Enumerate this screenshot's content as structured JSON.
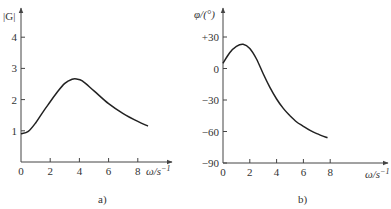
{
  "chart_data": [
    {
      "type": "line",
      "panel": "a)",
      "title": "",
      "ylabel": "|G|",
      "xlabel": "ω/s⁻¹",
      "xlim": [
        0,
        9
      ],
      "ylim": [
        0,
        4.5
      ],
      "xticks": [
        0,
        2,
        4,
        6,
        8
      ],
      "yticks": [
        1,
        2,
        3,
        4
      ],
      "grid": false,
      "series": [
        {
          "name": "|G|",
          "x": [
            0,
            0.5,
            1,
            1.5,
            2,
            2.5,
            3,
            3.5,
            3.8,
            4.2,
            5,
            6,
            7,
            8,
            8.7
          ],
          "y": [
            0.9,
            0.98,
            1.25,
            1.6,
            1.93,
            2.25,
            2.52,
            2.65,
            2.66,
            2.6,
            2.28,
            1.87,
            1.55,
            1.3,
            1.15
          ]
        }
      ]
    },
    {
      "type": "line",
      "panel": "b)",
      "title": "",
      "ylabel": "φ/(°)",
      "xlabel": "ω/s⁻¹",
      "xlim": [
        0,
        9.5
      ],
      "ylim": [
        -95,
        45
      ],
      "xticks": [
        0,
        2,
        4,
        6,
        8
      ],
      "yticks": [
        30,
        0,
        -30,
        -60,
        -90
      ],
      "ytick_labels": [
        "+30",
        "0",
        "−30",
        "−60",
        "−90"
      ],
      "grid": false,
      "series": [
        {
          "name": "φ",
          "x": [
            0,
            0.5,
            1,
            1.5,
            2,
            2.5,
            3,
            3.5,
            4,
            4.5,
            5,
            5.5,
            6,
            6.5,
            7,
            7.8
          ],
          "y": [
            5,
            15,
            21,
            23,
            19,
            9,
            -5,
            -18,
            -29,
            -38,
            -45,
            -51,
            -55,
            -59,
            -62,
            -66
          ]
        }
      ]
    }
  ],
  "panels": {
    "a": {
      "ylabel": "|G|",
      "xlabel": "ω/s",
      "xlabel_exp": "−1",
      "xticks": [
        "0",
        "2",
        "4",
        "6",
        "8"
      ],
      "yticks": [
        "1",
        "2",
        "3",
        "4"
      ],
      "caption": "a)"
    },
    "b": {
      "ylabel": "φ/(°)",
      "xlabel": "ω/s",
      "xlabel_exp": "−1",
      "xticks": [
        "0",
        "2",
        "4",
        "6",
        "8"
      ],
      "yticks": [
        "+30",
        "0",
        "−30",
        "−60",
        "−90"
      ],
      "caption": "b)"
    }
  }
}
